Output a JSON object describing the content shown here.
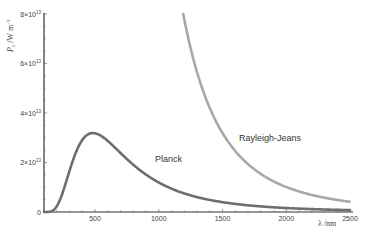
{
  "chart_data": {
    "type": "line",
    "title": "",
    "xlabel": "λ /nm",
    "ylabel": "P_λ /W m^-3",
    "xlim": [
      100,
      2500
    ],
    "ylim": [
      0,
      80000000000000.0
    ],
    "grid": false,
    "legend": "none (inline curve labels)",
    "x_ticks": [
      500,
      1000,
      1500,
      2000,
      2500
    ],
    "x_tick_labels": [
      "500",
      "1000",
      "1500",
      "2000",
      "2500"
    ],
    "y_ticks": [
      0,
      20000000000000.0,
      40000000000000.0,
      60000000000000.0,
      80000000000000.0
    ],
    "y_tick_labels": [
      "0",
      "2×10^13",
      "4×10^13",
      "6×10^13",
      "8×10^13"
    ],
    "series": [
      {
        "name": "Planck",
        "color": "#6e6e6e",
        "x": [
          100,
          200,
          300,
          400,
          486,
          600,
          800,
          1000,
          1250,
          1500,
          1750,
          2000,
          2250,
          2500
        ],
        "values": [
          0.0,
          2400000000000.0,
          17200000000000.0,
          29900000000000.0,
          32000000000000.0,
          29200000000000.0,
          19600000000000.0,
          12600000000000.0,
          7200000000000.0,
          4300000000000.0,
          2700000000000.0,
          1800000000000.0,
          1200000000000.0,
          850000000000.0
        ]
      },
      {
        "name": "Rayleigh-Jeans",
        "color": "#a8a8a8",
        "x": [
          1192,
          1250,
          1500,
          1750,
          2000,
          2250,
          2500
        ],
        "values": [
          80000000000000.0,
          66000000000000.0,
          32000000000000.0,
          17200000000000.0,
          10100000000000.0,
          6300000000000.0,
          4100000000000.0
        ]
      }
    ],
    "annotations": [
      {
        "text": "Planck",
        "x": 1050,
        "y": 21000000000000.0
      },
      {
        "text": "Rayleigh-Jeans",
        "x": 1600,
        "y": 30000000000000.0
      }
    ]
  },
  "labels": {
    "planck": "Planck",
    "rj": "Rayleigh-Jeans",
    "xlabel": "λ /nm"
  }
}
